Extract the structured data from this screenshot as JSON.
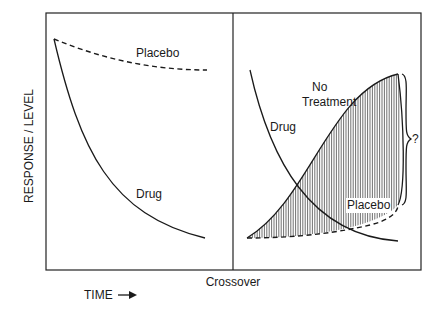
{
  "diagram": {
    "y_axis_label": "RESPONSE / LEVEL",
    "x_axis_label": "TIME",
    "x_axis_arrow": "right-arrow",
    "divider_label": "Crossover",
    "left_panel": {
      "curves": [
        {
          "name": "Placebo",
          "style": "dashed",
          "trend": "slight decline then plateau"
        },
        {
          "name": "Drug",
          "style": "solid",
          "trend": "steep exponential decline"
        }
      ],
      "labels": {
        "placebo": "Placebo",
        "drug": "Drug"
      }
    },
    "right_panel": {
      "curves": [
        {
          "name": "Drug",
          "style": "solid",
          "trend": "exponential decline"
        },
        {
          "name": "No Treatment",
          "style": "solid",
          "trend": "sigmoid rise"
        },
        {
          "name": "Placebo",
          "style": "dashed",
          "trend": "slow rise"
        }
      ],
      "labels": {
        "no_treatment_line1": "No",
        "no_treatment_line2": "Treatment",
        "drug": "Drug",
        "placebo": "Placebo"
      },
      "shaded_region": "between No Treatment and Placebo curves (vertical hatching)",
      "brace_label": "?"
    }
  }
}
